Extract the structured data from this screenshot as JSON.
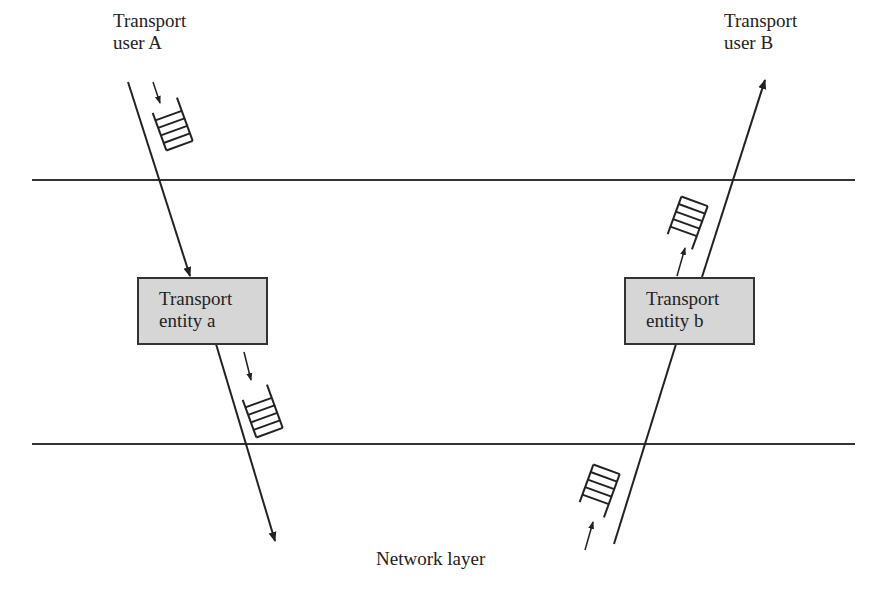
{
  "diagram": {
    "transport_user_a": {
      "line1": "Transport",
      "line2": "user A"
    },
    "transport_user_b": {
      "line1": "Transport",
      "line2": "user B"
    },
    "entity_a": {
      "line1": "Transport",
      "line2": "entity a"
    },
    "entity_b": {
      "line1": "Transport",
      "line2": "entity b"
    },
    "network_layer": "Network layer",
    "colors": {
      "stroke": "#222222",
      "box_fill": "#d6d6d6"
    }
  }
}
